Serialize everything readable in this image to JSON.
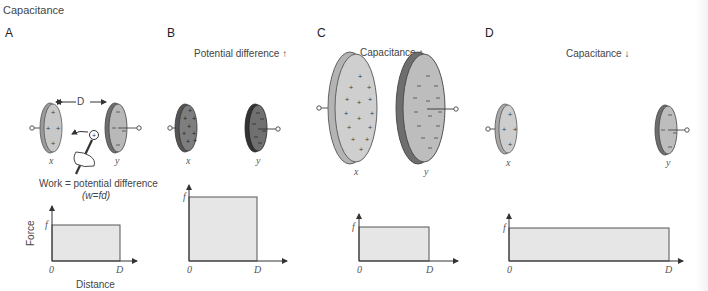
{
  "title": "Capacitance",
  "panels": [
    {
      "letter": "A",
      "plate_labels": [
        "x",
        "y"
      ],
      "distance_label": "D",
      "equation_line1": "Work = potential difference",
      "equation_line2": "(w=fd)",
      "graph": {
        "y_tick": "f",
        "x_ticks": [
          "0",
          "D"
        ],
        "ylabel": "Force",
        "xlabel": "Distance"
      }
    },
    {
      "letter": "B",
      "caption": "Potential difference",
      "caption_arrow": "up",
      "plate_labels": [
        "x",
        "y"
      ],
      "graph": {
        "y_tick": "f",
        "x_ticks": [
          "0",
          "D"
        ]
      }
    },
    {
      "letter": "C",
      "caption": "Capacitance",
      "caption_arrow": "up",
      "plate_labels": [
        "x",
        "y"
      ],
      "graph": {
        "y_tick": "f",
        "x_ticks": [
          "0",
          "D"
        ]
      }
    },
    {
      "letter": "D",
      "caption": "Capacitance",
      "caption_arrow": "down",
      "plate_labels": [
        "x",
        "y"
      ],
      "graph": {
        "y_tick": "f",
        "x_ticks": [
          "0",
          "D"
        ]
      }
    }
  ],
  "colors": {
    "plate_light": "#c8c8c8",
    "plate_edge": "#9a9a9a",
    "plate_dark": "#6e6e6e",
    "plate_dark_edge": "#4a4a4a",
    "graph_fill": "#e6e6e6",
    "line": "#555555"
  }
}
